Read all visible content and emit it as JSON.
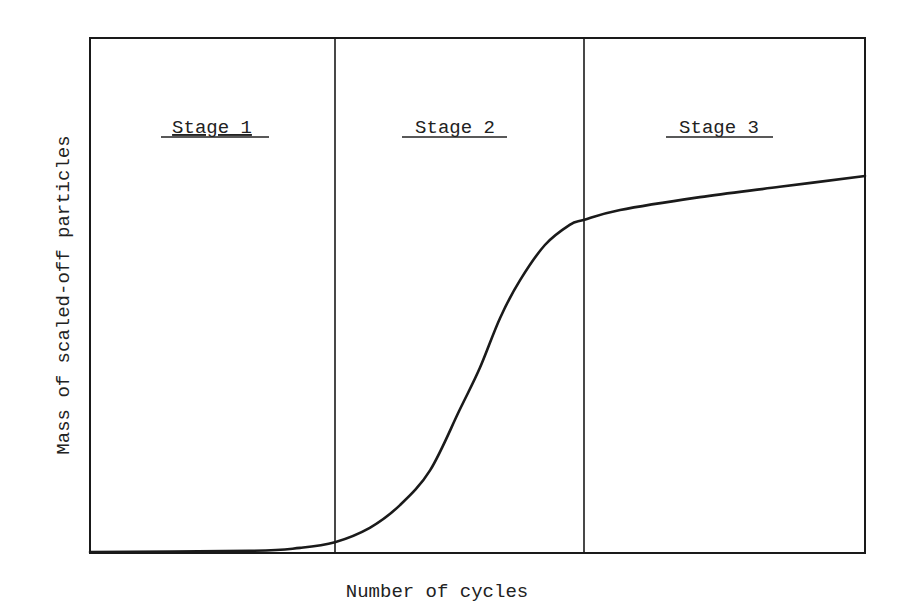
{
  "chart_data": {
    "type": "line",
    "title": "",
    "xlabel": "Number of cycles",
    "ylabel": "Mass of scaled-off particles",
    "grid": false,
    "legend": null,
    "axis_ticks": false,
    "annotations": [
      "Stage 1",
      "Stage 2",
      "Stage 3"
    ],
    "stage_boundaries_x": [
      0.316,
      0.638
    ],
    "xlim": [
      0,
      1
    ],
    "ylim": [
      0,
      1
    ],
    "series": [
      {
        "name": "Mass of scaled-off particles",
        "x": [
          0.0,
          0.206,
          0.271,
          0.316,
          0.361,
          0.4,
          0.439,
          0.477,
          0.503,
          0.529,
          0.555,
          0.587,
          0.619,
          0.638,
          0.684,
          0.787,
          0.89,
          1.0
        ],
        "y": [
          0.002,
          0.004,
          0.01,
          0.021,
          0.049,
          0.093,
          0.161,
          0.278,
          0.359,
          0.456,
          0.53,
          0.598,
          0.637,
          0.647,
          0.666,
          0.691,
          0.711,
          0.732
        ]
      }
    ]
  },
  "labels": {
    "stage1": "Stage 1",
    "stage2": "Stage 2",
    "stage3": "Stage 3",
    "xlabel": "Number of cycles",
    "ylabel": "Mass of scaled-off particles"
  },
  "colors": {
    "line": "#1a1a1a",
    "frame": "#1a1a1a",
    "background": "#ffffff"
  }
}
